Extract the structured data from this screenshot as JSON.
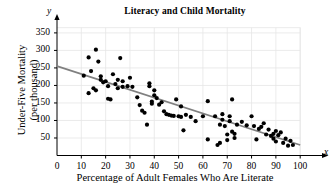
{
  "chart_data": {
    "type": "scatter",
    "title": "Literacy and Child Mortality",
    "xlabel": "Percentage of Adult Females Who Are Literate",
    "ylabel_line1": "Under-Five Mortality",
    "ylabel_line2": "(per thousand)",
    "x_axis_variable": "x",
    "y_axis_variable": "y",
    "xlim": [
      0,
      105
    ],
    "ylim": [
      0,
      370
    ],
    "xticks": [
      0,
      10,
      20,
      30,
      40,
      50,
      60,
      70,
      80,
      90,
      100
    ],
    "yticks": [
      50,
      100,
      150,
      200,
      250,
      300,
      350
    ],
    "grid": true,
    "grid_color": "#e6e6e6",
    "point_color": "#000000",
    "line_color": "#808080",
    "axis_color": "#000000",
    "trendline": {
      "label": "least-squares regression line",
      "x_start": 0,
      "y_start": 255,
      "x_end": 100,
      "y_end": 30
    },
    "points": [
      [
        11,
        228
      ],
      [
        13,
        280
      ],
      [
        13,
        178
      ],
      [
        14,
        241
      ],
      [
        15,
        192
      ],
      [
        16,
        302
      ],
      [
        16,
        186
      ],
      [
        17,
        268
      ],
      [
        18,
        216
      ],
      [
        18,
        226
      ],
      [
        19,
        209
      ],
      [
        20,
        212
      ],
      [
        21,
        198
      ],
      [
        21,
        162
      ],
      [
        22,
        160
      ],
      [
        23,
        232
      ],
      [
        24,
        204
      ],
      [
        25,
        216
      ],
      [
        25,
        192
      ],
      [
        26,
        278
      ],
      [
        27,
        212
      ],
      [
        27,
        196
      ],
      [
        29,
        198
      ],
      [
        30,
        222
      ],
      [
        31,
        196
      ],
      [
        33,
        166
      ],
      [
        34,
        144
      ],
      [
        35,
        128
      ],
      [
        36,
        122
      ],
      [
        37,
        88
      ],
      [
        38,
        206
      ],
      [
        38,
        198
      ],
      [
        39,
        154
      ],
      [
        39,
        148
      ],
      [
        40,
        186
      ],
      [
        40,
        172
      ],
      [
        41,
        164
      ],
      [
        42,
        145
      ],
      [
        43,
        152
      ],
      [
        44,
        126
      ],
      [
        45,
        118
      ],
      [
        46,
        116
      ],
      [
        47,
        114
      ],
      [
        48,
        113
      ],
      [
        49,
        160
      ],
      [
        50,
        112
      ],
      [
        51,
        140
      ],
      [
        51,
        110
      ],
      [
        52,
        72
      ],
      [
        53,
        116
      ],
      [
        55,
        110
      ],
      [
        57,
        98
      ],
      [
        60,
        112
      ],
      [
        62,
        155
      ],
      [
        62,
        46
      ],
      [
        65,
        112
      ],
      [
        66,
        30
      ],
      [
        67,
        88
      ],
      [
        67,
        36
      ],
      [
        68,
        118
      ],
      [
        68,
        102
      ],
      [
        69,
        84
      ],
      [
        70,
        60
      ],
      [
        70,
        44
      ],
      [
        71,
        98
      ],
      [
        71,
        112
      ],
      [
        72,
        160
      ],
      [
        72,
        68
      ],
      [
        73,
        50
      ],
      [
        73,
        62
      ],
      [
        74,
        88
      ],
      [
        76,
        96
      ],
      [
        78,
        86
      ],
      [
        80,
        112
      ],
      [
        81,
        84
      ],
      [
        82,
        46
      ],
      [
        83,
        76
      ],
      [
        84,
        82
      ],
      [
        85,
        92
      ],
      [
        86,
        60
      ],
      [
        87,
        74
      ],
      [
        88,
        56
      ],
      [
        89,
        62
      ],
      [
        89,
        48
      ],
      [
        90,
        70
      ],
      [
        90,
        40
      ],
      [
        91,
        58
      ],
      [
        92,
        66
      ],
      [
        93,
        36
      ],
      [
        94,
        48
      ],
      [
        95,
        28
      ],
      [
        96,
        42
      ],
      [
        97,
        30
      ]
    ]
  }
}
